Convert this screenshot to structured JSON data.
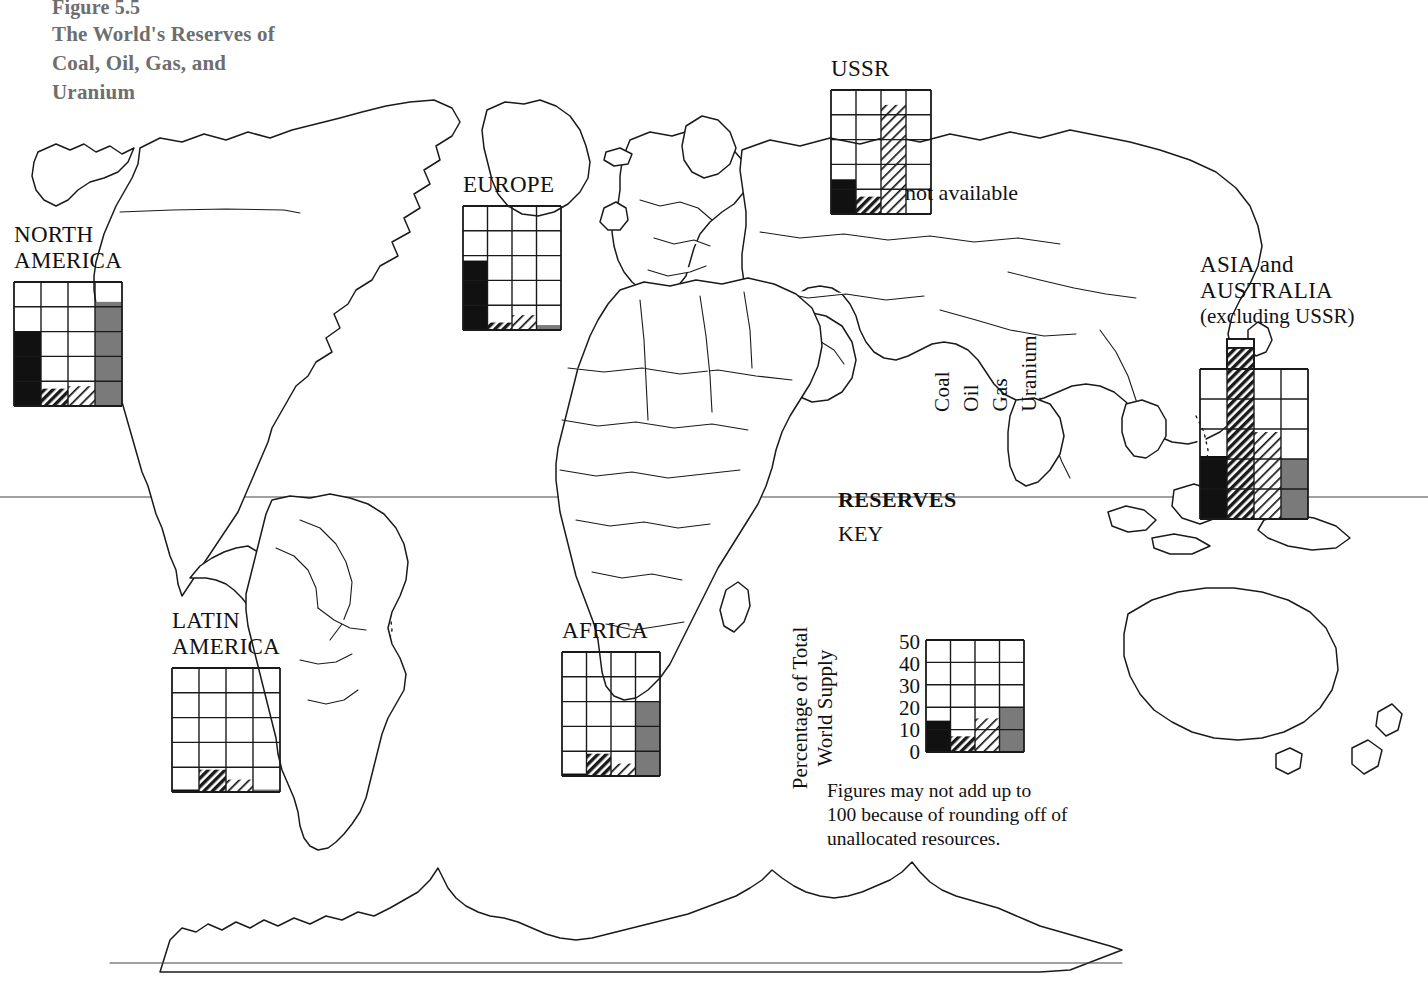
{
  "title": {
    "figure_number": "Figure 5.5",
    "text": "The World's\nReserves of Coal,\nOil, Gas, and\nUranium",
    "color": "#6e6e6e"
  },
  "key": {
    "reserves_heading": "RESERVES",
    "key_heading": "KEY",
    "axis_title": "Percentage of Total\nWorld Supply",
    "y_ticks": [
      "50",
      "40",
      "30",
      "20",
      "10",
      "0"
    ],
    "column_headers": [
      "Coal",
      "Oil",
      "Gas",
      "Uranium"
    ],
    "footnote": "Figures may not add up to\n100 because of rounding off of\nunallocated resources."
  },
  "not_available_label": "not available",
  "fills": {
    "coal": "#111111",
    "oil": "hatch-dark",
    "gas": "hatch-light",
    "uranium": "#7a7a7a",
    "empty": "#ffffff",
    "grid": "#1a1a1a"
  },
  "chart_data": {
    "type": "bar",
    "title": "The World's Reserves of Coal, Oil, Gas, and Uranium",
    "ylabel": "Percentage of Total World Supply",
    "xlabel": "",
    "ylim": [
      0,
      50
    ],
    "grid": true,
    "legend": "Coal, Oil, Gas, Uranium",
    "categories": [
      "Coal",
      "Oil",
      "Gas",
      "Uranium"
    ],
    "units": "percent of total world supply",
    "panels": [
      {
        "region": "NORTH\nAMERICA",
        "values": [
          30,
          7,
          8,
          42
        ],
        "notes": ""
      },
      {
        "region": "LATIN\nAMERICA",
        "values": [
          1,
          9,
          5,
          1
        ],
        "notes": ""
      },
      {
        "region": "EUROPE",
        "values": [
          28,
          3,
          6,
          2
        ],
        "notes": ""
      },
      {
        "region": "AFRICA",
        "values": [
          1,
          9,
          5,
          30
        ],
        "notes": ""
      },
      {
        "region": "USSR",
        "values": [
          14,
          7,
          44,
          null
        ],
        "notes": "Uranium not available"
      },
      {
        "region": "ASIA and AUSTRALIA\n(excluding USSR)",
        "values": [
          21,
          57,
          29,
          20
        ],
        "notes": "Oil exceeds the 50% axis maximum"
      },
      {
        "region": "KEY",
        "values": [
          14,
          7,
          15,
          20
        ],
        "notes": "world-average key sample"
      }
    ]
  },
  "regions": [
    {
      "id": "north-america",
      "label": "NORTH\nAMERICA"
    },
    {
      "id": "latin-america",
      "label": "LATIN\nAMERICA"
    },
    {
      "id": "europe",
      "label": "EUROPE"
    },
    {
      "id": "africa",
      "label": "AFRICA"
    },
    {
      "id": "ussr",
      "label": "USSR"
    },
    {
      "id": "asia-australia",
      "label": "ASIA and AUSTRALIA",
      "sub": "(excluding USSR)"
    }
  ]
}
